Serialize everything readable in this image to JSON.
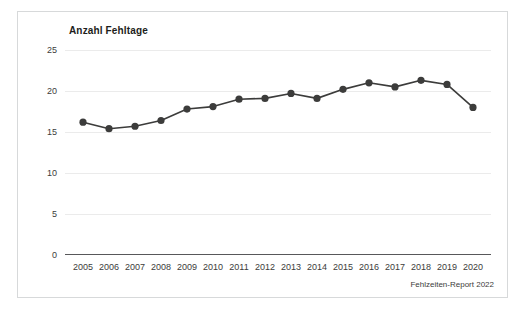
{
  "source_note": "Fehlzeiten-Report 2022",
  "chart_data": {
    "type": "line",
    "title": "Anzahl Fehltage",
    "xlabel": "",
    "ylabel": "",
    "categories": [
      "2005",
      "2006",
      "2007",
      "2008",
      "2009",
      "2010",
      "2011",
      "2012",
      "2013",
      "2014",
      "2015",
      "2016",
      "2017",
      "2018",
      "2019",
      "2020"
    ],
    "values": [
      16.2,
      15.4,
      15.7,
      16.4,
      17.8,
      18.1,
      19.0,
      19.1,
      19.7,
      19.1,
      20.2,
      21.0,
      20.5,
      21.3,
      20.8,
      18.0
    ],
    "series": [
      {
        "name": "Anzahl Fehltage",
        "values": [
          16.2,
          15.4,
          15.7,
          16.4,
          17.8,
          18.1,
          19.0,
          19.1,
          19.7,
          19.1,
          20.2,
          21.0,
          20.5,
          21.3,
          20.8,
          18.0
        ]
      }
    ],
    "ylim": [
      0,
      25
    ],
    "yticks": [
      0,
      5,
      10,
      15,
      20,
      25
    ],
    "ytick_labels": [
      "0",
      "5",
      "10",
      "15",
      "20",
      "25"
    ],
    "grid": true,
    "grid_axis": "y",
    "legend": false,
    "legend_position": "none",
    "line_color": "#3c3c3b",
    "marker_color": "#3c3c3b",
    "marker": "circle",
    "grid_color": "#ebebeb",
    "axis_color": "#58585a",
    "background": "#ffffff",
    "border_color": "#d7d9da"
  }
}
